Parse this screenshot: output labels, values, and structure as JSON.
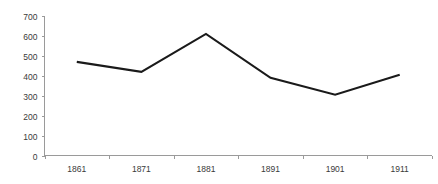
{
  "chart_data": {
    "type": "line",
    "title": "",
    "subtitle": "",
    "xlabel": "",
    "ylabel": "",
    "categories": [
      "1861",
      "1871",
      "1881",
      "1891",
      "1901",
      "1911"
    ],
    "values": [
      470,
      420,
      610,
      390,
      305,
      405
    ],
    "series": [
      {
        "name": "",
        "values": [
          470,
          420,
          610,
          390,
          305,
          405
        ]
      }
    ],
    "ylim": [
      0,
      700
    ],
    "yticks": [
      0,
      100,
      200,
      300,
      400,
      500,
      600,
      700
    ],
    "ytick_labels": [
      "0",
      "100",
      "200",
      "300",
      "400",
      "500",
      "600",
      "700"
    ],
    "xtick_labels": [
      "1861",
      "1871",
      "1881",
      "1891",
      "1901",
      "1911"
    ],
    "grid": false,
    "legend": false,
    "legend_position": "none",
    "annotations": [],
    "colors": {
      "line": "#1a1a1a",
      "axis": "#9a9a9a",
      "label": "#3a3a3a",
      "background": "#ffffff"
    }
  }
}
